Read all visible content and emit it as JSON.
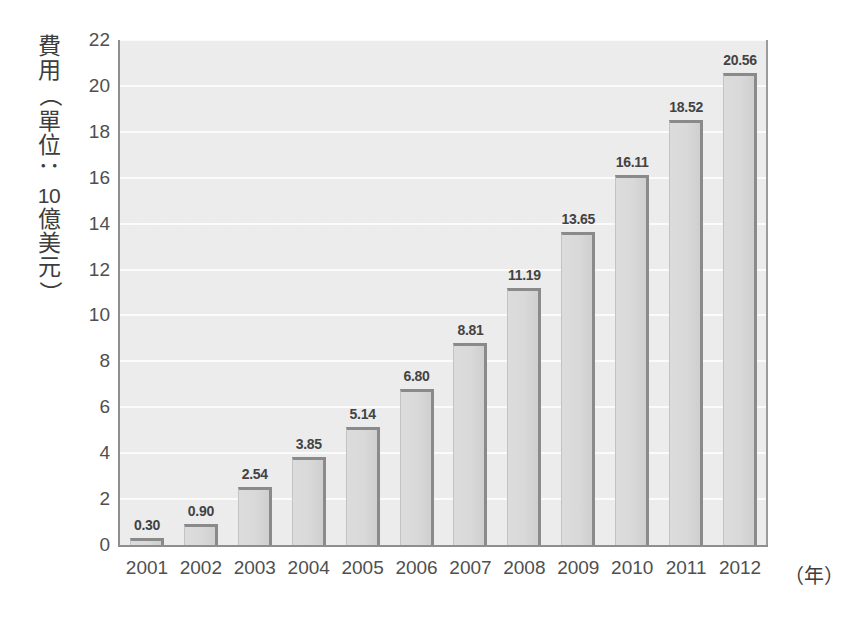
{
  "chart_data": {
    "type": "bar",
    "title": "",
    "subtitle": "",
    "xlabel": "（年）",
    "ylabel": "費用（單位：10億美元）",
    "categories": [
      "2001",
      "2002",
      "2003",
      "2004",
      "2005",
      "2006",
      "2007",
      "2008",
      "2009",
      "2010",
      "2011",
      "2012"
    ],
    "values": [
      0.3,
      0.9,
      2.54,
      3.85,
      5.14,
      6.8,
      8.81,
      11.19,
      13.65,
      16.11,
      18.52,
      20.56
    ],
    "value_labels": [
      "0.30",
      "0.90",
      "2.54",
      "3.85",
      "5.14",
      "6.80",
      "8.81",
      "11.19",
      "13.65",
      "16.11",
      "18.52",
      "20.56"
    ],
    "ylim": [
      0,
      22
    ],
    "ytick_values": [
      0,
      2,
      4,
      6,
      8,
      10,
      12,
      14,
      16,
      18,
      20,
      22
    ],
    "ytick_labels": [
      "0",
      "2",
      "4",
      "6",
      "8",
      "10",
      "12",
      "14",
      "16",
      "18",
      "20",
      "22"
    ],
    "grid": true,
    "grid_axis": "y",
    "legend": false,
    "legend_position": "none",
    "series": [
      {
        "name": "費用",
        "values": [
          0.3,
          0.9,
          2.54,
          3.85,
          5.14,
          6.8,
          8.81,
          11.19,
          13.65,
          16.11,
          18.52,
          20.56
        ]
      }
    ]
  },
  "axis_title_vertical_chars": [
    "費",
    "用",
    "（",
    "單",
    "位",
    "：",
    "10",
    "億",
    "美",
    "元",
    "）"
  ],
  "colors": {
    "background": "#ffffff",
    "plot_background": "#ececec",
    "gridline": "#fbfbfb",
    "bar_fill": "#d9d9d9",
    "bar_edge": "#8a8a8a",
    "axis_line": "#8e8e8e",
    "tick_text": "#4f4f4f",
    "label_text": "#434343"
  }
}
